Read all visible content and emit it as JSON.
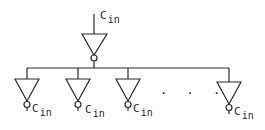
{
  "diagram": {
    "driver": {
      "label_main": "C",
      "label_sub": "in"
    },
    "loads": [
      {
        "label_main": "C",
        "label_sub": "in"
      },
      {
        "label_main": "C",
        "label_sub": "in"
      },
      {
        "label_main": "C",
        "label_sub": "in"
      },
      {
        "label_main": "C",
        "label_sub": "in"
      }
    ],
    "ellipsis": ". . .",
    "colors": {
      "stroke": "#2a2a2a",
      "background": "#ffffff"
    }
  }
}
